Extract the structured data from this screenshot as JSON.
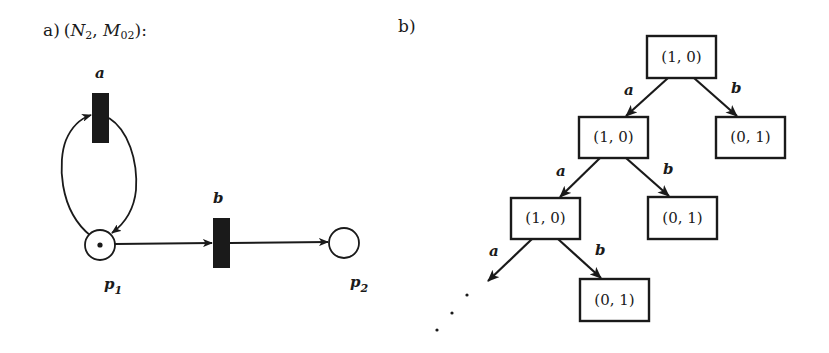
{
  "figure": {
    "panel_a": {
      "label": "a)",
      "title_open": "(",
      "net_symbol": "N",
      "net_subscript": "2",
      "separator": ", ",
      "marking_symbol": "M",
      "marking_subscript": "02",
      "title_close": "):",
      "transitions": [
        {
          "id": "a",
          "label": "a"
        },
        {
          "id": "b",
          "label": "b"
        }
      ],
      "places": [
        {
          "id": "p1",
          "symbol": "p",
          "subscript": "1",
          "tokens": 1
        },
        {
          "id": "p2",
          "symbol": "p",
          "subscript": "2",
          "tokens": 0
        }
      ],
      "arcs": [
        {
          "from": "p1",
          "to": "a"
        },
        {
          "from": "a",
          "to": "p1"
        },
        {
          "from": "p1",
          "to": "b"
        },
        {
          "from": "b",
          "to": "p2"
        }
      ]
    },
    "panel_b": {
      "label": "b)",
      "nodes": [
        {
          "id": "n0",
          "marking": "(1, 0)"
        },
        {
          "id": "n1",
          "marking": "(1, 0)"
        },
        {
          "id": "n2",
          "marking": "(0, 1)"
        },
        {
          "id": "n3",
          "marking": "(1, 0)"
        },
        {
          "id": "n4",
          "marking": "(0, 1)"
        },
        {
          "id": "n5",
          "marking": "(0, 1)"
        }
      ],
      "edges": [
        {
          "from": "n0",
          "to": "n1",
          "label": "a"
        },
        {
          "from": "n0",
          "to": "n2",
          "label": "b"
        },
        {
          "from": "n1",
          "to": "n3",
          "label": "a"
        },
        {
          "from": "n1",
          "to": "n4",
          "label": "b"
        },
        {
          "from": "n3",
          "to": "continuation",
          "label": "a"
        },
        {
          "from": "n3",
          "to": "n5",
          "label": "b"
        }
      ],
      "continuation": "..."
    }
  }
}
